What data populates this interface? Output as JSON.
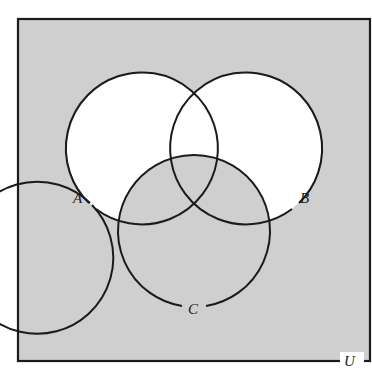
{
  "diagram": {
    "type": "venn",
    "universe_label": "U",
    "sets": [
      {
        "label": "A"
      },
      {
        "label": "B"
      },
      {
        "label": "C"
      }
    ],
    "shaded_region": "(A ∪ B)' ∪ C",
    "colors": {
      "shade": "#cfcfcf",
      "unshaded": "#ffffff",
      "stroke": "#1a1a1a"
    }
  }
}
